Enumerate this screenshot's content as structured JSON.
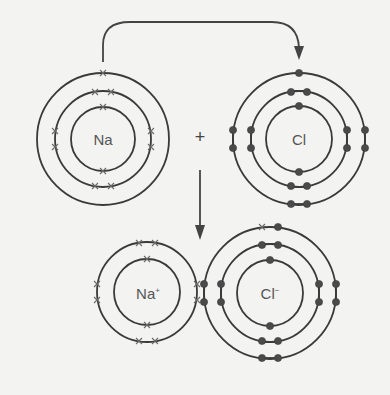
{
  "diagram": {
    "colors": {
      "background": "#f3f3f1",
      "shell_stroke": "#3a3a3a",
      "chlorine_electron": "#4a4a4a",
      "sodium_electron": "#6a6a6a"
    },
    "reactants": {
      "sodium": {
        "symbol": "Na",
        "shells": [
          2,
          8,
          1
        ],
        "electron_marker": "cross"
      },
      "chlorine": {
        "symbol": "Cl",
        "shells": [
          2,
          8,
          7
        ],
        "electron_marker": "dot"
      },
      "operator": "+"
    },
    "products": {
      "sodium_ion": {
        "symbol": "Na",
        "charge": "+",
        "shells": [
          2,
          8
        ],
        "electron_marker": "cross"
      },
      "chloride_ion": {
        "symbol": "Cl",
        "charge": "−",
        "shells": [
          2,
          8,
          8
        ],
        "electron_marker": "dot",
        "transferred_electron_marker": "cross"
      }
    },
    "arrows": {
      "electron_transfer": "curved arrow from Na outer-shell electron to Cl outer shell",
      "reaction": "downward arrow from reactants to products"
    }
  }
}
